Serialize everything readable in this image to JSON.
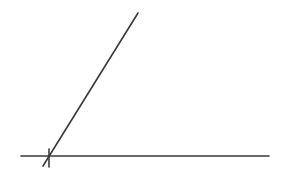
{
  "diagram": {
    "type": "angle",
    "background": "#ffffff",
    "stroke_color": "#3a3a3a",
    "stroke_width": 1.6,
    "lines": [
      {
        "name": "baseline",
        "x1": 21,
        "y1": 156,
        "x2": 269,
        "y2": 156
      },
      {
        "name": "ray",
        "x1": 43,
        "y1": 166,
        "x2": 138,
        "y2": 13
      }
    ],
    "marks": [
      {
        "name": "vertex-tick",
        "x1": 49,
        "y1": 149,
        "x2": 49,
        "y2": 167
      }
    ]
  }
}
